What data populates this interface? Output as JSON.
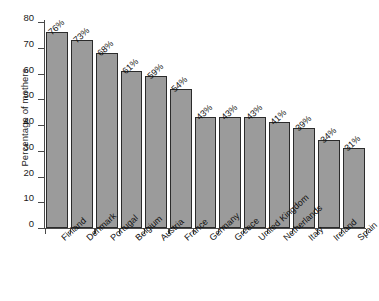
{
  "chart_data": {
    "type": "bar",
    "title": "",
    "xlabel": "",
    "ylabel": "Percentage of mothers",
    "ylim": [
      0,
      80
    ],
    "yticks": [
      0,
      10,
      20,
      30,
      40,
      50,
      60,
      70,
      80
    ],
    "ytick_labels": [
      "0",
      "10",
      "20",
      "30",
      "40",
      "50",
      "60",
      "70",
      "80"
    ],
    "grid": false,
    "legend": null,
    "bar_color": "#9b9b9b",
    "bar_edge_color": "#2b2b2b",
    "background_color": "#ffffff",
    "categories": [
      "Finland",
      "Denmark",
      "Portugal",
      "Belgium",
      "Austria",
      "France",
      "Germany",
      "Greece",
      "United Kingdom",
      "Netherlands",
      "Italy",
      "Ireland",
      "Spain"
    ],
    "values": [
      76,
      73,
      68,
      61,
      59,
      54,
      43,
      43,
      43,
      41,
      39,
      34,
      31
    ],
    "data_labels": [
      "76%",
      "73%",
      "68%",
      "61%",
      "59%",
      "54%",
      "43%",
      "43%",
      "43%",
      "41%",
      "39%",
      "34%",
      "31%"
    ]
  }
}
